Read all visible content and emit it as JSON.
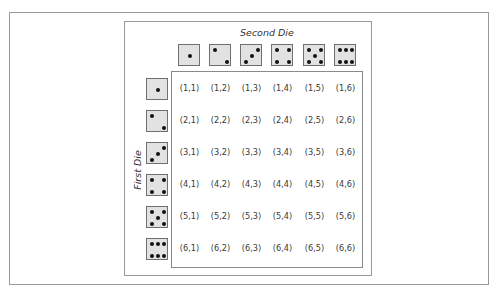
{
  "diagram": {
    "column_axis_label": "Second Die",
    "row_axis_label": "First Die",
    "column_headers": [
      {
        "value": 1,
        "icon": "die-face-1-icon"
      },
      {
        "value": 2,
        "icon": "die-face-2-icon"
      },
      {
        "value": 3,
        "icon": "die-face-3-icon"
      },
      {
        "value": 4,
        "icon": "die-face-4-icon"
      },
      {
        "value": 5,
        "icon": "die-face-5-icon"
      },
      {
        "value": 6,
        "icon": "die-face-6-icon"
      }
    ],
    "row_headers": [
      {
        "value": 1,
        "icon": "die-face-1-icon"
      },
      {
        "value": 2,
        "icon": "die-face-2-icon"
      },
      {
        "value": 3,
        "icon": "die-face-3-icon"
      },
      {
        "value": 4,
        "icon": "die-face-4-icon"
      },
      {
        "value": 5,
        "icon": "die-face-5-icon"
      },
      {
        "value": 6,
        "icon": "die-face-6-icon"
      }
    ],
    "cells": [
      [
        "(1,1)",
        "(1,2)",
        "(1,3)",
        "(1,4)",
        "(1,5)",
        "(1,6)"
      ],
      [
        "(2,1)",
        "(2,2)",
        "(2,3)",
        "(2,4)",
        "(2,5)",
        "(2,6)"
      ],
      [
        "(3,1)",
        "(3,2)",
        "(3,3)",
        "(3,4)",
        "(3,5)",
        "(3,6)"
      ],
      [
        "(4,1)",
        "(4,2)",
        "(4,3)",
        "(4,4)",
        "(4,5)",
        "(4,6)"
      ],
      [
        "(5,1)",
        "(5,2)",
        "(5,3)",
        "(5,4)",
        "(5,5)",
        "(5,6)"
      ],
      [
        "(6,1)",
        "(6,2)",
        "(6,3)",
        "(6,4)",
        "(6,5)",
        "(6,6)"
      ]
    ],
    "colors": {
      "die_face": "#e2e2e2",
      "die_border": "#6f6f6f",
      "pip": "#111111",
      "frame_border": "#9a9a9a"
    }
  }
}
